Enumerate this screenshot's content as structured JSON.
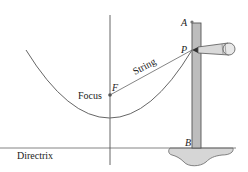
{
  "diagram": {
    "labels": {
      "point_a": "A",
      "point_p": "P",
      "point_b": "B",
      "point_f": "F",
      "focus": "Focus",
      "string": "String",
      "directrix": "Directrix"
    },
    "colors": {
      "line": "#555555",
      "ruler_fill": "#bdbdbd",
      "pencil_fill": "#d9d9d9",
      "base_fill": "#d6d6d6"
    }
  }
}
